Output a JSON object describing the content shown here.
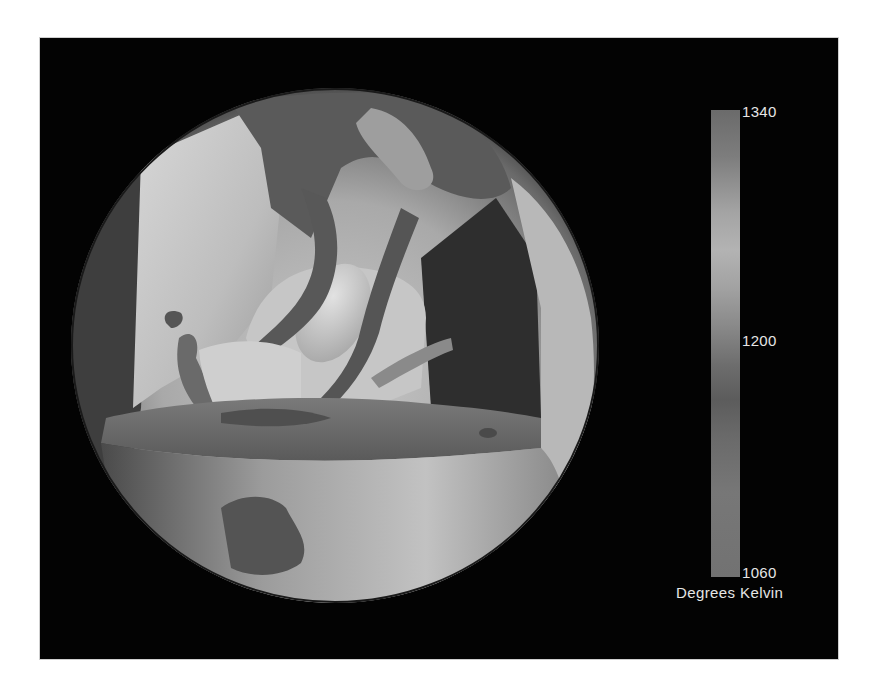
{
  "figure": {
    "background_color": "#030303",
    "page_background": "#ffffff"
  },
  "colorbar": {
    "max_label": "1340",
    "mid_label": "1200",
    "min_label": "1060",
    "unit_label": "Degrees Kelvin",
    "range": [
      1060,
      1340
    ],
    "tick_values": [
      1340,
      1200,
      1060
    ],
    "orientation": "vertical",
    "colors": {
      "top": "#6b6b6b",
      "peak_light": "#b3b3b3",
      "mid_dark": "#5c5c5c",
      "bottom": "#727272"
    }
  },
  "sphere": {
    "shading": "grayscale",
    "features": [
      "outer shell surface",
      "cut-away wedge with dark interior face",
      "central light ovoid plume",
      "rising dark tubular upwellings",
      "horizontal cut plane near equator"
    ]
  }
}
